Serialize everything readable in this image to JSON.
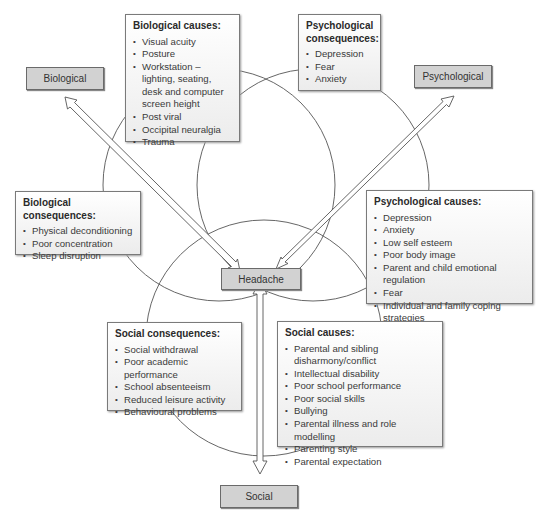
{
  "nodes": {
    "biological": "Biological",
    "psychological": "Psychological",
    "headache": "Headache",
    "social": "Social"
  },
  "boxes": {
    "biological_causes": {
      "title": "Biological causes:",
      "items": [
        "Visual acuity",
        "Posture",
        "Workstation – lighting, seating, desk and computer screen height",
        "Post viral",
        "Occipital neuralgia",
        "Trauma"
      ]
    },
    "psychological_consequences": {
      "title": "Psychological consequences:",
      "items": [
        "Depression",
        "Fear",
        "Anxiety"
      ]
    },
    "biological_consequences": {
      "title": "Biological consequences:",
      "items": [
        "Physical deconditioning",
        "Poor concentration",
        "Sleep disruption"
      ]
    },
    "psychological_causes": {
      "title": "Psychological causes:",
      "items": [
        "Depression",
        "Anxiety",
        "Low self esteem",
        "Poor body image",
        "Parent and child emotional regulation",
        "Fear",
        "Individual and family coping strategies"
      ]
    },
    "social_consequences": {
      "title": "Social consequences:",
      "items": [
        "Social withdrawal",
        "Poor academic performance",
        "School absenteeism",
        "Reduced leisure activity",
        "Behavioural problems"
      ]
    },
    "social_causes": {
      "title": "Social causes:",
      "items": [
        "Parental and sibling disharmony/conflict",
        "Intellectual disability",
        "Poor school performance",
        "Poor social skills",
        "Bullying",
        "Parental illness and role modelling",
        "Parenting style",
        "Parental expectation"
      ]
    }
  },
  "colors": {
    "node_fill": "#d2d2d2",
    "line": "#555555"
  }
}
